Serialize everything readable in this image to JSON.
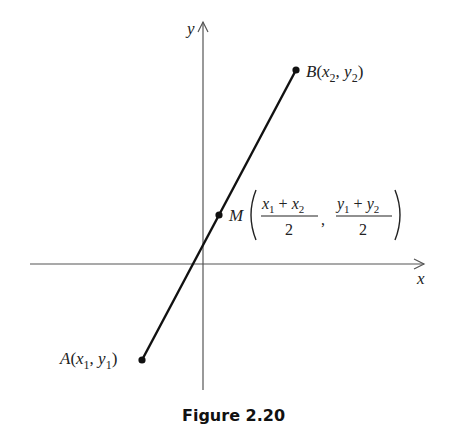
{
  "figure": {
    "caption": "Figure 2.20",
    "axes": {
      "x_label": "x",
      "y_label": "y"
    },
    "points": {
      "A": {
        "name": "A",
        "label_x": "x",
        "label_x_sub": "1",
        "label_y": "y",
        "label_y_sub": "1"
      },
      "B": {
        "name": "B",
        "label_x": "x",
        "label_x_sub": "2",
        "label_y": "y",
        "label_y_sub": "2"
      },
      "M": {
        "name": "M",
        "num1": "x",
        "num1_sub": "1",
        "num1_op": "+",
        "num1b": "x",
        "num1b_sub": "2",
        "den1": "2",
        "num2": "y",
        "num2_sub": "1",
        "num2_op": "+",
        "num2b": "y",
        "num2b_sub": "2",
        "den2": "2",
        "separator": ","
      }
    },
    "colors": {
      "segment": "#111111",
      "axes": "#555555",
      "text": "#222222"
    }
  }
}
